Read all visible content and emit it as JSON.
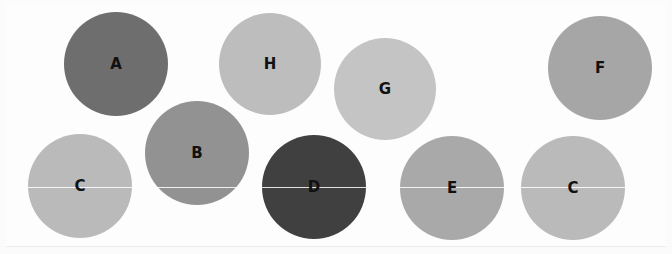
{
  "diagram": {
    "type": "labeled-circles",
    "background": "#fdfdfd",
    "circles": [
      {
        "id": "A",
        "label": "A",
        "cx": 116,
        "cy": 64,
        "r": 52,
        "color": "#6e6e6e"
      },
      {
        "id": "H",
        "label": "H",
        "cx": 270,
        "cy": 64,
        "r": 51,
        "color": "#bdbdbd"
      },
      {
        "id": "G",
        "label": "G",
        "cx": 385,
        "cy": 89,
        "r": 51,
        "color": "#c4c4c4"
      },
      {
        "id": "F",
        "label": "F",
        "cx": 600,
        "cy": 68,
        "r": 52,
        "color": "#a6a6a6"
      },
      {
        "id": "C1",
        "label": "C",
        "cx": 80,
        "cy": 186,
        "r": 52,
        "color": "#bababa"
      },
      {
        "id": "B",
        "label": "B",
        "cx": 197,
        "cy": 153,
        "r": 52,
        "color": "#929292"
      },
      {
        "id": "D",
        "label": "D",
        "cx": 314,
        "cy": 187,
        "r": 52,
        "color": "#404040"
      },
      {
        "id": "E",
        "label": "E",
        "cx": 452,
        "cy": 188,
        "r": 52,
        "color": "#a9a9a9"
      },
      {
        "id": "C2",
        "label": "C",
        "cx": 573,
        "cy": 188,
        "r": 52,
        "color": "#bababa"
      }
    ],
    "guide_line": {
      "y": 187,
      "x1": 28,
      "x2": 625,
      "color": "#ffffff"
    }
  }
}
